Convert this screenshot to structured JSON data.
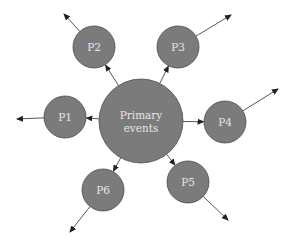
{
  "diagram": {
    "type": "hub-and-spoke",
    "colors": {
      "node_fill": "#7b7b7b",
      "node_stroke": "#4a4a4a",
      "label": "#e6e6e6",
      "arrow": "#444444",
      "background": "#ffffff"
    },
    "center": {
      "id": "primary",
      "label_line1": "Primary",
      "label_line2": "events",
      "cx": 141,
      "cy": 121,
      "r": 42
    },
    "nodes": [
      {
        "id": "P1",
        "label": "P1",
        "cx": 65,
        "cy": 117,
        "r": 21,
        "out_x": 17,
        "out_y": 119
      },
      {
        "id": "P2",
        "label": "P2",
        "cx": 94,
        "cy": 47,
        "r": 21,
        "out_x": 64,
        "out_y": 14
      },
      {
        "id": "P3",
        "label": "P3",
        "cx": 178,
        "cy": 47,
        "r": 21,
        "out_x": 231,
        "out_y": 15
      },
      {
        "id": "P4",
        "label": "P4",
        "cx": 225,
        "cy": 122,
        "r": 21,
        "out_x": 278,
        "out_y": 89
      },
      {
        "id": "P5",
        "label": "P5",
        "cx": 188,
        "cy": 182,
        "r": 21,
        "out_x": 228,
        "out_y": 220
      },
      {
        "id": "P6",
        "label": "P6",
        "cx": 103,
        "cy": 190,
        "r": 21,
        "out_x": 70,
        "out_y": 232
      }
    ],
    "edges": [
      {
        "from": "Primary events",
        "to": "P1"
      },
      {
        "from": "Primary events",
        "to": "P2"
      },
      {
        "from": "Primary events",
        "to": "P3"
      },
      {
        "from": "Primary events",
        "to": "P4"
      },
      {
        "from": "Primary events",
        "to": "P5"
      },
      {
        "from": "Primary events",
        "to": "P6"
      },
      {
        "from": "P1",
        "to": "outward"
      },
      {
        "from": "P2",
        "to": "outward"
      },
      {
        "from": "P3",
        "to": "outward"
      },
      {
        "from": "P4",
        "to": "outward"
      },
      {
        "from": "P5",
        "to": "outward"
      },
      {
        "from": "P6",
        "to": "outward"
      }
    ]
  }
}
